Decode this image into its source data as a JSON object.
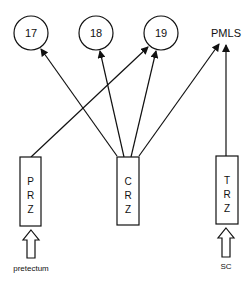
{
  "diagram": {
    "targets": [
      {
        "id": "17",
        "label": "17",
        "shape": "circle",
        "cx": 31,
        "cy": 33,
        "r": 17
      },
      {
        "id": "18",
        "label": "18",
        "shape": "circle",
        "cx": 96,
        "cy": 33,
        "r": 17
      },
      {
        "id": "19",
        "label": "19",
        "shape": "circle",
        "cx": 161,
        "cy": 33,
        "r": 17
      },
      {
        "id": "PMLS",
        "label": "PMLS",
        "shape": "text",
        "x": 226,
        "y": 33
      }
    ],
    "zones": [
      {
        "id": "PRZ",
        "letters": [
          "P",
          "R",
          "Z"
        ],
        "x": 20,
        "y": 157,
        "w": 21,
        "h": 69
      },
      {
        "id": "CRZ",
        "letters": [
          "C",
          "R",
          "Z"
        ],
        "x": 117,
        "y": 157,
        "w": 22,
        "h": 68
      },
      {
        "id": "TRZ",
        "letters": [
          "T",
          "R",
          "Z"
        ],
        "x": 216,
        "y": 156,
        "w": 22,
        "h": 68
      }
    ],
    "inputs": [
      {
        "id": "pretectum",
        "label": "pretectum",
        "cx": 31,
        "top": 230,
        "bottom": 258,
        "label_y": 268
      },
      {
        "id": "sc",
        "label": "SC",
        "cx": 226,
        "top": 228,
        "bottom": 257,
        "label_y": 266
      }
    ],
    "connections": [
      {
        "from": "PRZ",
        "to": "19",
        "x1": 31,
        "y1": 157,
        "x2": 148,
        "y2": 47
      },
      {
        "from": "CRZ",
        "to": "17",
        "x1": 117,
        "y1": 156,
        "x2": 41,
        "y2": 49
      },
      {
        "from": "CRZ",
        "to": "18",
        "x1": 124,
        "y1": 157,
        "x2": 100,
        "y2": 51
      },
      {
        "from": "CRZ",
        "to": "19",
        "x1": 131,
        "y1": 157,
        "x2": 156,
        "y2": 51
      },
      {
        "from": "CRZ",
        "to": "PMLS",
        "x1": 139,
        "y1": 156,
        "x2": 219,
        "y2": 44
      },
      {
        "from": "TRZ",
        "to": "PMLS",
        "x1": 226,
        "y1": 156,
        "x2": 226,
        "y2": 45
      }
    ],
    "colors": {
      "stroke": "#111111",
      "background": "#ffffff"
    }
  }
}
